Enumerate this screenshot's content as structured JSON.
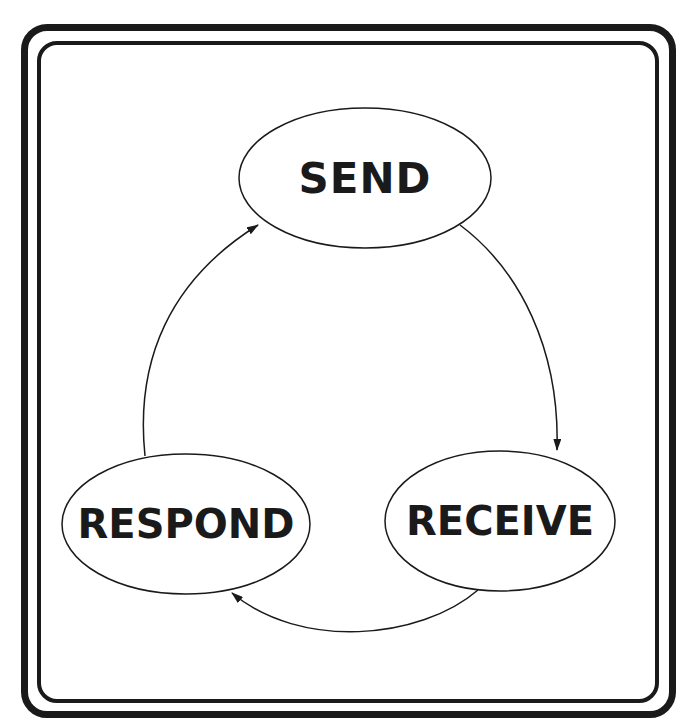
{
  "diagram": {
    "type": "cycle",
    "nodes": [
      {
        "id": "send",
        "label": "SEND"
      },
      {
        "id": "receive",
        "label": "RECEIVE"
      },
      {
        "id": "respond",
        "label": "RESPOND"
      }
    ],
    "edges": [
      {
        "from": "send",
        "to": "receive"
      },
      {
        "from": "receive",
        "to": "respond"
      },
      {
        "from": "respond",
        "to": "send"
      }
    ],
    "colors": {
      "stroke": "#1a1a1a",
      "background": "#ffffff"
    }
  }
}
